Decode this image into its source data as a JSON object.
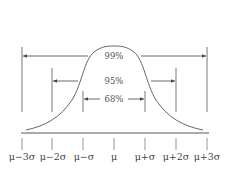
{
  "diagram": {
    "title": "",
    "curve": "normal-distribution",
    "intervals": [
      {
        "label": "99%",
        "range": "μ±3σ"
      },
      {
        "label": "95%",
        "range": "μ±2σ"
      },
      {
        "label": "68%",
        "range": "μ±σ"
      }
    ],
    "axis_labels": [
      "μ−3σ",
      "μ−2σ",
      "μ−σ",
      "μ",
      "μ+σ",
      "μ+2σ",
      "μ+3σ"
    ],
    "colors": {
      "line": "#444444",
      "text": "#555555",
      "background": "#ffffff"
    }
  }
}
